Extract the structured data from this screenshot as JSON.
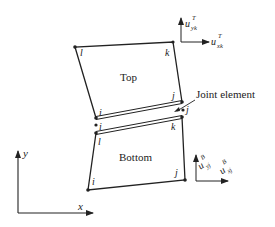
{
  "diagram": {
    "top_element": {
      "label": "Top",
      "nodes": {
        "l": "l",
        "k": "k",
        "j": "j",
        "i": "i"
      }
    },
    "bottom_element": {
      "label": "Bottom",
      "nodes": {
        "l": "l",
        "k": "k",
        "j": "j",
        "i": "i"
      }
    },
    "joint_element": {
      "label": "Joint element",
      "nodes": {
        "i": "i",
        "j": "j",
        "l": "l",
        "k": "k"
      }
    },
    "global_axes": {
      "x": "x",
      "y": "y"
    },
    "top_displacements": {
      "vertical": {
        "base": "u",
        "sub": "yk",
        "sup": "T"
      },
      "horizontal": {
        "base": "u",
        "sub": "xk",
        "sup": "T"
      }
    },
    "bottom_displacements": {
      "vertical": {
        "base": "u",
        "sub": "yj",
        "sup": "B"
      },
      "horizontal": {
        "base": "u",
        "sub": "xj",
        "sup": "B"
      }
    },
    "colors": {
      "line": "#222222",
      "background": "#ffffff"
    }
  }
}
